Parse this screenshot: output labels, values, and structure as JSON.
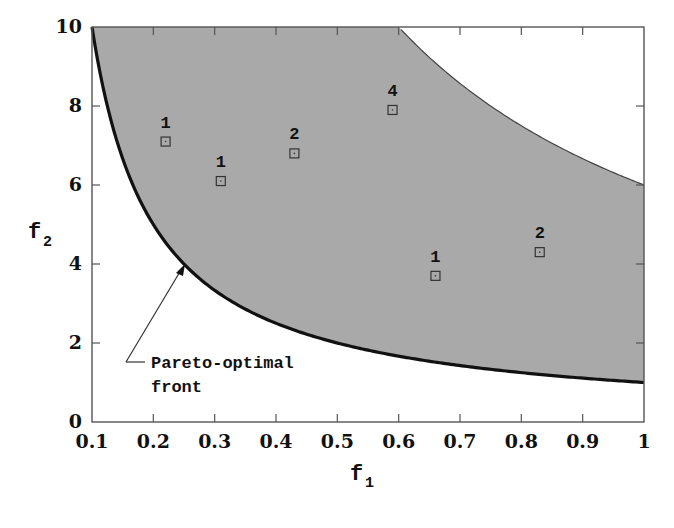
{
  "chart_data": {
    "type": "scatter",
    "title": "",
    "xlabel": "f1",
    "ylabel": "f2",
    "xlim": [
      0.1,
      1.0
    ],
    "ylim": [
      0,
      10
    ],
    "grid": false,
    "legend": null,
    "xticks": [
      "0.1",
      "0.2",
      "0.3",
      "0.4",
      "0.5",
      "0.6",
      "0.7",
      "0.8",
      "0.9",
      "1"
    ],
    "yticks": [
      "0",
      "2",
      "4",
      "6",
      "8",
      "10"
    ],
    "feasible_region": {
      "description": "Shaded gray feasible region between the Pareto-optimal front (lower boundary) and upper boundary curve",
      "lower_boundary": "f2 = 1/f1",
      "upper_boundary": "f2 = 6/f1 (capped at 10)",
      "fill_color": "#a9a9a9"
    },
    "series": [
      {
        "name": "solutions",
        "marker": "square",
        "points": [
          {
            "f1": 0.22,
            "f2": 7.1,
            "label": "1"
          },
          {
            "f1": 0.31,
            "f2": 6.1,
            "label": "1"
          },
          {
            "f1": 0.43,
            "f2": 6.8,
            "label": "2"
          },
          {
            "f1": 0.59,
            "f2": 7.9,
            "label": "4"
          },
          {
            "f1": 0.66,
            "f2": 3.7,
            "label": "1"
          },
          {
            "f1": 0.83,
            "f2": 4.3,
            "label": "2"
          }
        ]
      }
    ],
    "annotations": [
      {
        "text_line1": "Pareto-optimal",
        "text_line2": "front",
        "arrow_to": {
          "f1": 0.25,
          "f2": 4.0
        }
      }
    ]
  },
  "labels": {
    "x_main": "f",
    "x_sub": "1",
    "y_main": "f",
    "y_sub": "2",
    "annot_line1": "Pareto-optimal",
    "annot_line2": "front"
  },
  "colors": {
    "region": "#a9a9a9",
    "front": "#111111",
    "upper": "#444444",
    "axis": "#555555"
  }
}
